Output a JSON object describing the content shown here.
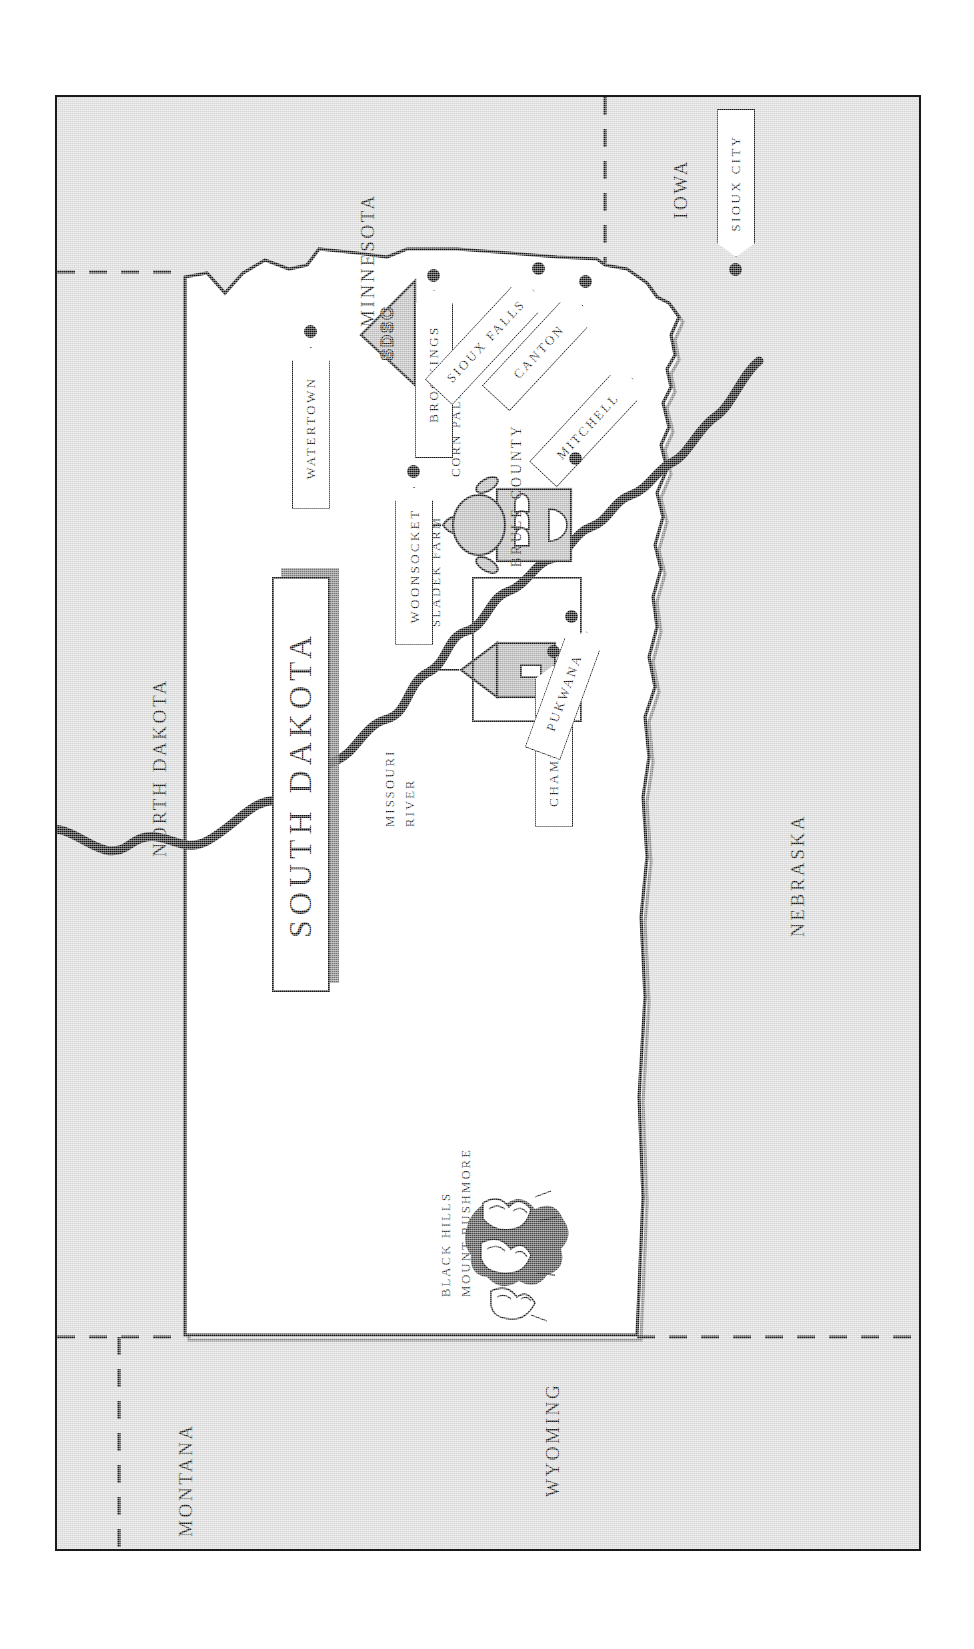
{
  "map": {
    "title": "SOUTH DAKOTA",
    "orientation": "rotated-90-ccw",
    "frame": {
      "border_color": "#1a1a1a",
      "land_color": "#ffffff",
      "surround_color": "#d7d7d7"
    },
    "neighbor_states": [
      {
        "name": "NORTH DAKOTA",
        "position": "north"
      },
      {
        "name": "MINNESOTA",
        "position": "northeast"
      },
      {
        "name": "IOWA",
        "position": "east"
      },
      {
        "name": "NEBRASKA",
        "position": "south"
      },
      {
        "name": "WYOMING",
        "position": "southwest"
      },
      {
        "name": "MONTANA",
        "position": "northwest"
      }
    ],
    "cities": [
      {
        "name": "WATERTOWN",
        "type": "sign"
      },
      {
        "name": "BROOKINGS",
        "type": "sign"
      },
      {
        "name": "SIOUX FALLS",
        "type": "sign"
      },
      {
        "name": "CANTON",
        "type": "sign"
      },
      {
        "name": "MITCHELL",
        "type": "sign"
      },
      {
        "name": "WOONSOCKET",
        "type": "sign"
      },
      {
        "name": "CHAMBERLAIN",
        "type": "sign"
      },
      {
        "name": "PUKWANA",
        "type": "sign"
      },
      {
        "name": "SIOUX CITY",
        "type": "sign",
        "state": "IOWA"
      }
    ],
    "landmarks": [
      {
        "name": "SDSC",
        "type": "pennant"
      },
      {
        "name": "CORN PALACE",
        "type": "building-icon"
      },
      {
        "name": "SLADEK FARM",
        "type": "farm-icon"
      },
      {
        "name": "BLACK HILLS",
        "type": "illustration-label"
      },
      {
        "name": "MOUNT RUSHMORE",
        "type": "illustration-label"
      }
    ],
    "regions": [
      {
        "name": "BRULE COUNTY",
        "type": "county-outline"
      }
    ],
    "water": [
      {
        "name_line1": "MISSOURI",
        "name_line2": "RIVER",
        "type": "river"
      }
    ]
  }
}
